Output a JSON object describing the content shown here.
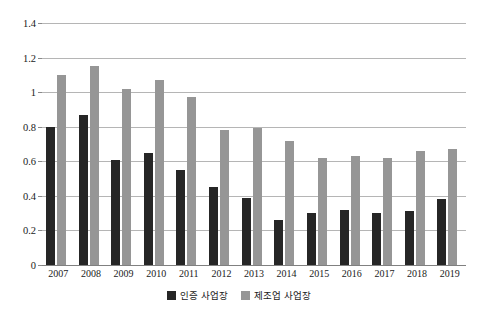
{
  "chart_data": {
    "type": "bar",
    "title": "",
    "subtitle": "",
    "xlabel": "",
    "ylabel": "",
    "categories": [
      "2007",
      "2008",
      "2009",
      "2010",
      "2011",
      "2012",
      "2013",
      "2014",
      "2015",
      "2016",
      "2017",
      "2018",
      "2019"
    ],
    "series": [
      {
        "name": "인증 사업장",
        "color": "#262626",
        "values": [
          0.8,
          0.87,
          0.61,
          0.65,
          0.55,
          0.45,
          0.39,
          0.26,
          0.3,
          0.32,
          0.3,
          0.31,
          0.38
        ]
      },
      {
        "name": "제조업 사업장",
        "color": "#969696",
        "values": [
          1.1,
          1.15,
          1.02,
          1.07,
          0.97,
          0.78,
          0.79,
          0.72,
          0.62,
          0.63,
          0.62,
          0.66,
          0.67
        ]
      }
    ],
    "ylim": [
      0,
      1.4
    ],
    "y_ticks": [
      "0",
      "0.2",
      "0.4",
      "0.6",
      "0.8",
      "1",
      "1.2",
      "1.4"
    ],
    "y_tick_values": [
      0,
      0.2,
      0.4,
      0.6,
      0.8,
      1.0,
      1.2,
      1.4
    ],
    "grid": true,
    "grid_color": "#b5b5b5",
    "legend_position": "bottom",
    "background": "#ffffff"
  }
}
